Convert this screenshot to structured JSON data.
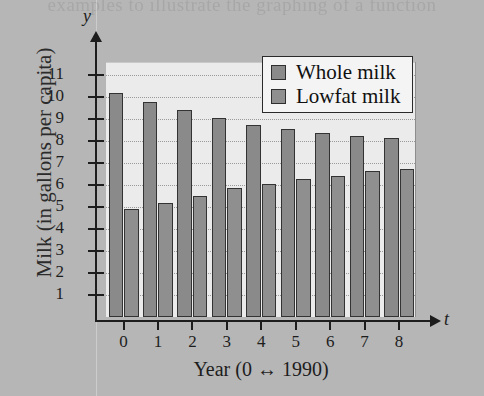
{
  "page": {
    "bleed_text": "examples to illustrate the graphing of a function"
  },
  "chart_data": {
    "type": "bar",
    "title": "",
    "xlabel": "Year (0 ↔ 1990)",
    "ylabel": "Milk (in gallons per capita)",
    "x_axis_symbol": "t",
    "y_axis_symbol": "y",
    "categories": [
      "0",
      "1",
      "2",
      "3",
      "4",
      "5",
      "6",
      "7",
      "8"
    ],
    "ylim": [
      0,
      11.6
    ],
    "yticks": [
      11,
      10,
      9,
      8,
      7,
      6,
      5,
      4,
      3,
      2,
      1
    ],
    "ytick_labels": [
      "11",
      "10",
      "9",
      "8",
      "7",
      "6",
      "5",
      "4",
      "3",
      "2",
      "1"
    ],
    "grid": true,
    "legend_position": "top-right",
    "series": [
      {
        "name": "Whole milk",
        "color": "#8a8a8a",
        "values": [
          10.2,
          9.8,
          9.4,
          9.05,
          8.75,
          8.55,
          8.35,
          8.25,
          8.15
        ]
      },
      {
        "name": "Lowfat milk",
        "color": "#8f8f8f",
        "values": [
          4.9,
          5.2,
          5.5,
          5.85,
          6.05,
          6.3,
          6.4,
          6.65,
          6.75
        ]
      }
    ]
  }
}
